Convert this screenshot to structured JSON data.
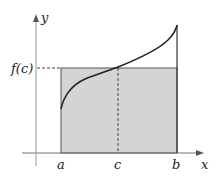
{
  "diagram": {
    "axes": {
      "x_label": "x",
      "y_label": "y"
    },
    "ticks": {
      "a": "a",
      "c": "c",
      "b": "b"
    },
    "level_label": "f(c)",
    "colors": {
      "rect_fill": "#d4d4d4",
      "line": "#333333",
      "axis": "#888888"
    }
  }
}
